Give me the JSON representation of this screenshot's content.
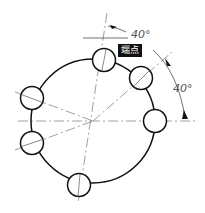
{
  "drawing": {
    "type": "bolt-circle-hole-pattern",
    "hole_count": 6,
    "dimensions": [
      {
        "id": "top-angle",
        "text": "40°"
      },
      {
        "id": "right-angle",
        "text": "40°"
      }
    ],
    "snap_tooltip": {
      "text": "端点"
    }
  }
}
